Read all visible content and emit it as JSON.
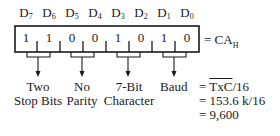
{
  "bit_labels": [
    {
      "name": "D",
      "sub": "7"
    },
    {
      "name": "D",
      "sub": "6"
    },
    {
      "name": "D",
      "sub": "5"
    },
    {
      "name": "D",
      "sub": "4"
    },
    {
      "name": "D",
      "sub": "3"
    },
    {
      "name": "D",
      "sub": "2"
    },
    {
      "name": "D",
      "sub": "1"
    },
    {
      "name": "D",
      "sub": "0"
    }
  ],
  "bits": [
    "1",
    "1",
    "0",
    "0",
    "1",
    "0",
    "1",
    "0"
  ],
  "register_value": {
    "prefix": "= CA",
    "sub": "H"
  },
  "groups": [
    {
      "line1": "Two",
      "line2": "Stop Bits"
    },
    {
      "line1": "No",
      "line2": "Parity"
    },
    {
      "line1": "7-Bit",
      "line2": "Character"
    },
    {
      "line1": "Baud",
      "line2": ""
    }
  ],
  "baud_equation": {
    "line1_prefix": "= ",
    "line1_overline": "TxC",
    "line1_suffix": "/16",
    "line2": "= 153.6 k/16",
    "line3": "= 9,600"
  },
  "colors": {
    "ink": "#1a1a1a",
    "background": "#ffffff"
  }
}
